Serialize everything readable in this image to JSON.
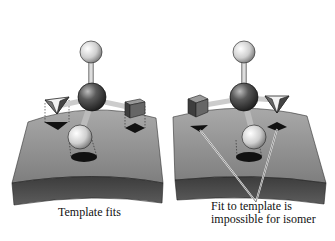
{
  "figure": {
    "panels": [
      {
        "id": "left",
        "caption": "Template fits",
        "molecule": {
          "center": "dark-sphere",
          "top": "light-sphere",
          "front": "light-sphere",
          "left": "pyramid",
          "right": "cube"
        },
        "template_sites": [
          "triangle-site",
          "diamond-site",
          "oval-site"
        ],
        "fit": true
      },
      {
        "id": "right",
        "caption_lines": [
          "Fit to template is",
          "impossible for isomer"
        ],
        "molecule": {
          "center": "dark-sphere",
          "top": "light-sphere",
          "front": "light-sphere",
          "left": "cube",
          "right": "pyramid"
        },
        "template_sites": [
          "triangle-site",
          "diamond-site",
          "oval-site"
        ],
        "fit": false
      }
    ],
    "colors": {
      "slab_top": "#8a8a8a",
      "slab_side": "#4a4a4a",
      "sphere_light": "#d8d8d8",
      "sphere_dark": "#3a3a3a",
      "site": "#111111"
    }
  }
}
